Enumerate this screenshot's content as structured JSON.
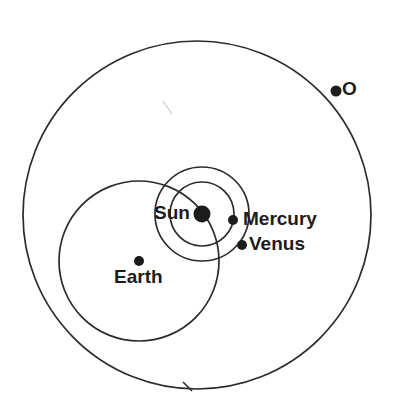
{
  "diagram": {
    "ink_color": "#2b2b2b",
    "background_color": "#ffffff",
    "stroke_width": 1.6
  },
  "bodies": [
    {
      "id": "sun",
      "label": "Sun",
      "marker": "filled-dot",
      "cx": 202,
      "cy": 214,
      "r": 8.5,
      "label_x": 154,
      "label_y": 203
    },
    {
      "id": "mercury",
      "label": "Mercury",
      "marker": "filled-dot",
      "cx": 233,
      "cy": 220,
      "r": 5,
      "label_x": 243,
      "label_y": 209
    },
    {
      "id": "venus",
      "label": "Venus",
      "marker": "filled-dot",
      "cx": 242,
      "cy": 245,
      "r": 5,
      "label_x": 249,
      "label_y": 234
    },
    {
      "id": "earth",
      "label": "Earth",
      "marker": "filled-dot",
      "cx": 139,
      "cy": 261,
      "r": 5,
      "label_x": 114,
      "label_y": 267
    },
    {
      "id": "outer-body",
      "label": "O",
      "marker": "filled-dot",
      "cx": 336,
      "cy": 91,
      "r": 5.5,
      "label_x": 342,
      "label_y": 79
    }
  ],
  "orbits": [
    {
      "id": "mercury-orbit",
      "name": "mercury-orbit-circle",
      "cx": 202,
      "cy": 214,
      "r": 32
    },
    {
      "id": "venus-orbit",
      "name": "venus-orbit-circle",
      "cx": 202,
      "cy": 214,
      "r": 47
    },
    {
      "id": "earth-orbit",
      "name": "earth-orbit-circle",
      "cx": 139,
      "cy": 261,
      "r": 80
    },
    {
      "id": "outer-orbit",
      "name": "outer-orbit-circle",
      "cx": 197,
      "cy": 215,
      "r": 174
    }
  ],
  "marks": [
    {
      "id": "bottom-tick",
      "name": "orbit-direction-tick",
      "x1": 183,
      "y1": 382,
      "x2": 192,
      "y2": 391
    },
    {
      "id": "smudge",
      "name": "pencil-smudge",
      "x1": 163,
      "y1": 101,
      "x2": 172,
      "y2": 114
    }
  ]
}
